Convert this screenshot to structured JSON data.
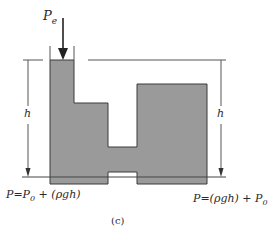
{
  "diagram": {
    "type": "hydrostatic-pressure-vessels",
    "external_pressure_label": "P",
    "external_pressure_subscript": "e",
    "height_label_left": "h",
    "height_label_right": "h",
    "formula_left": {
      "prefix": "P=P",
      "subscript": "0",
      "suffix": " + (ρgh)"
    },
    "formula_right": {
      "prefix": "P=(ρgh) + P",
      "subscript": "0"
    },
    "caption": "(c)",
    "colors": {
      "fluid": "#9a9a9a",
      "outline": "#3a3a3a",
      "lines": "#555555",
      "background": "#ffffff"
    }
  }
}
